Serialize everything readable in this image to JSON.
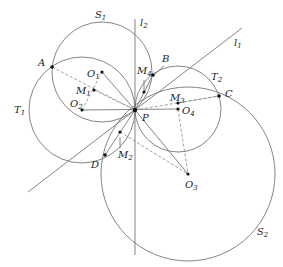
{
  "labels": {
    "S1": "S",
    "S1_sub": "1",
    "S2": "S",
    "S2_sub": "2",
    "T1": "T",
    "T1_sub": "1",
    "T2": "T",
    "T2_sub": "2",
    "l1": "l",
    "l1_sub": "1",
    "l2": "l",
    "l2_sub": "2",
    "A": "A",
    "B": "B",
    "C": "C",
    "D": "D",
    "P": "P",
    "O1": "O",
    "O1_sub": "1",
    "O2": "O",
    "O2_sub": "2",
    "O3": "O",
    "O3_sub": "3",
    "O4": "O",
    "O4_sub": "4",
    "M1": "M",
    "M1_sub": "1",
    "M2": "M",
    "M2_sub": "2",
    "M3": "M",
    "M3_sub": "3",
    "M4": "M",
    "M4_sub": "4"
  }
}
